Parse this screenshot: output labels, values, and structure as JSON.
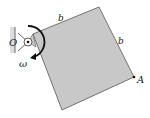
{
  "diagram": {
    "labels": {
      "pivot": "O",
      "side_top": "b",
      "side_right": "b",
      "corner": "A",
      "angular_velocity": "ω"
    },
    "colors": {
      "plate_fill": "#c8c8c8",
      "plate_stroke": "#555555",
      "wall_fill": "#dcdcdc",
      "arrow": "#111111"
    }
  }
}
